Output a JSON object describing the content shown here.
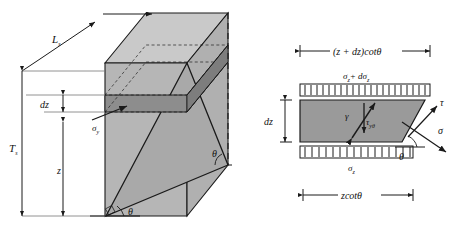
{
  "figure": {
    "type": "engineering-diagram",
    "panels": [
      "prism-3d-view",
      "element-2d-free-body"
    ]
  },
  "colors": {
    "face_light": "#c9c9c9",
    "face_mid": "#b0b0b0",
    "face_dark": "#8f8f8f",
    "slice_dark": "#8a8a8a",
    "element_fill": "#9a9a9a",
    "stroke": "#1a1a1a",
    "background": "#ffffff"
  },
  "left_panel": {
    "name": "prism-3d-view",
    "labels": {
      "length": "L",
      "length_sub": "s",
      "thickness": "T",
      "thickness_sub": "s",
      "slice": "dz",
      "depth": "z",
      "stress_sigma": "σ",
      "stress_sigma_sub": "y",
      "angle_bottom_left": "θ",
      "angle_bottom_right": "θ"
    }
  },
  "right_panel": {
    "name": "element-2d-free-body",
    "labels": {
      "top_dimension": "(z + dz)cotθ",
      "bottom_dimension": "zcotθ",
      "height": "dz",
      "top_stress": "σ",
      "top_stress_sub": "z",
      "top_stress_increment": "+ dσ",
      "top_stress_increment_sub": "z",
      "bottom_stress": "σ",
      "bottom_stress_sub": "z",
      "shear_strain": "γ",
      "shear_stress": "τ",
      "shear_stress_sub": "yθ",
      "normal_arrow": "σ",
      "tangent_arrow": "τ",
      "angle": "θ"
    }
  }
}
